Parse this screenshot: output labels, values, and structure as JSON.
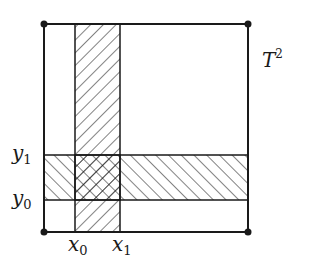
{
  "diagram": {
    "title_label": "T",
    "title_exponent": "2",
    "square": {
      "x": 44,
      "y": 24,
      "w": 204,
      "h": 208
    },
    "vertical_strip": {
      "x0": 75,
      "x1": 120
    },
    "horizontal_strip": {
      "y0": 200,
      "y1": 155
    },
    "x_labels": [
      {
        "base": "x",
        "sub": "0"
      },
      {
        "base": "x",
        "sub": "1"
      }
    ],
    "y_labels": [
      {
        "base": "y",
        "sub": "1"
      },
      {
        "base": "y",
        "sub": "0"
      }
    ],
    "colors": {
      "stroke": "#1a1a1a",
      "background": "#ffffff"
    }
  }
}
